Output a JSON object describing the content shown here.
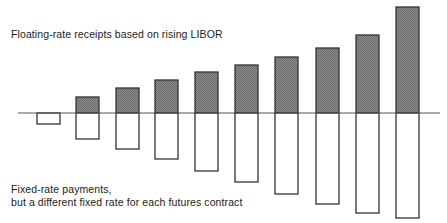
{
  "figure": {
    "width": 447,
    "height": 223,
    "background": "#ffffff",
    "title": "Floating-rate receipts based on rising LIBOR"
  },
  "annotations": {
    "top_label": "Floating-rate receipts based on rising LIBOR",
    "bottom_label_line1": "Fixed-rate payments,",
    "bottom_label_line2": "but a different fixed rate for each futures contract"
  },
  "colors": {
    "stroke": "#333333",
    "axis": "#555555",
    "receipt_fill": "#808080",
    "payment_fill": "#ffffff",
    "text": "#1b1b1b"
  },
  "chart_data": {
    "type": "bar",
    "title": "Floating-rate receipts based on rising LIBOR",
    "subtitle": "Fixed-rate payments, but a different fixed rate for each futures contract",
    "xlabel": "",
    "ylabel": "",
    "grid": false,
    "legend": "none",
    "categories": [
      "1",
      "2",
      "3",
      "4",
      "5",
      "6",
      "7",
      "8",
      "9",
      "10"
    ],
    "axis_baseline": 0,
    "ylim": [
      -106,
      106
    ],
    "series": [
      {
        "name": "Floating-rate receipts based on rising LIBOR",
        "fill": "#808080",
        "values": [
          0,
          16,
          25,
          33,
          41,
          48,
          56,
          65,
          78,
          106
        ]
      },
      {
        "name": "Fixed-rate payments",
        "fill": "#ffffff",
        "values": [
          -11,
          -26,
          -36,
          -46,
          -58,
          -69,
          -81,
          -91,
          -100,
          -105
        ]
      }
    ],
    "bar_geometry": {
      "baseline_y": 113,
      "axis_x_start": 18,
      "axis_x_end": 440,
      "bar_width": 23,
      "bars": [
        {
          "x": 37,
          "top": 113,
          "bottom": 124
        },
        {
          "x": 76,
          "top": 97,
          "bottom": 139
        },
        {
          "x": 116,
          "top": 88,
          "bottom": 149
        },
        {
          "x": 155,
          "top": 80,
          "bottom": 159
        },
        {
          "x": 195,
          "top": 72,
          "bottom": 171
        },
        {
          "x": 235,
          "top": 65,
          "bottom": 182
        },
        {
          "x": 275,
          "top": 57,
          "bottom": 194
        },
        {
          "x": 316,
          "top": 48,
          "bottom": 204
        },
        {
          "x": 356,
          "top": 35,
          "bottom": 213
        },
        {
          "x": 396,
          "top": 7,
          "bottom": 218
        }
      ]
    }
  }
}
